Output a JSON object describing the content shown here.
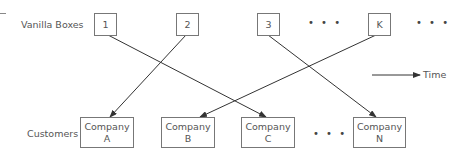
{
  "labels": {
    "top_row": "Vanilla Boxes",
    "bottom_row": "Customers",
    "time": "Time"
  },
  "vanilla_boxes": [
    {
      "label": "1"
    },
    {
      "label": "2"
    },
    {
      "label": "3"
    },
    {
      "label": "K"
    }
  ],
  "customers": [
    {
      "line1": "Company",
      "line2": "A"
    },
    {
      "line1": "Company",
      "line2": "B"
    },
    {
      "line1": "Company",
      "line2": "C"
    },
    {
      "line1": "Company",
      "line2": "N"
    }
  ],
  "ellipsis": "• • •",
  "connections": [
    {
      "from": "1",
      "to": "Company C"
    },
    {
      "from": "2",
      "to": "Company A"
    },
    {
      "from": "3",
      "to": "Company N"
    },
    {
      "from": "K",
      "to": "Company B"
    }
  ],
  "colors": {
    "line": "#333333",
    "border": "#777777",
    "text": "#555555"
  }
}
